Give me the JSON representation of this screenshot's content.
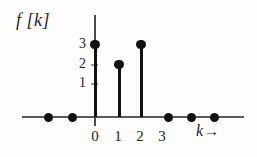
{
  "figure": {
    "ylabel": "f [k]",
    "xlabel": "k",
    "xlabel_arrow": "→"
  },
  "chart_data": {
    "type": "bar",
    "title": "",
    "subtitle": "",
    "xlabel": "k",
    "ylabel": "f[k]",
    "x": [
      -2,
      -1,
      0,
      1,
      2,
      3,
      4,
      5
    ],
    "values": [
      0,
      0,
      3,
      2,
      3,
      0,
      0,
      0
    ],
    "categories": [
      "-2",
      "-1",
      "0",
      "1",
      "2",
      "3",
      "4",
      "5"
    ],
    "xlim": [
      -2.8,
      6.0
    ],
    "ylim": [
      0,
      3.6
    ],
    "xticks": [
      0,
      1,
      2,
      3
    ],
    "xtick_labels": [
      "0",
      "1",
      "2",
      "3"
    ],
    "yticks": [
      1,
      2,
      3
    ],
    "ytick_labels": [
      "1",
      "2",
      "3"
    ],
    "grid": false,
    "legend": null,
    "marker": "filled-circle"
  },
  "yticks": [
    {
      "label": "3",
      "top": 37,
      "mark_top": 44
    },
    {
      "label": "2",
      "top": 57,
      "mark_top": 64
    },
    {
      "label": "1",
      "top": 76,
      "mark_top": 83
    }
  ],
  "xticks": [
    {
      "label": "0",
      "left": 87
    },
    {
      "label": "1",
      "left": 110
    },
    {
      "label": "2",
      "left": 132
    },
    {
      "label": "3",
      "left": 154
    }
  ],
  "stems": [
    {
      "k": "0",
      "left": 93.5,
      "top": 44,
      "height": 73
    },
    {
      "k": "1",
      "left": 117.5,
      "top": 64,
      "height": 53
    },
    {
      "k": "2",
      "left": 139.5,
      "top": 44,
      "height": 73
    }
  ],
  "stem_dots": [
    {
      "k": "0",
      "left": 90.3,
      "top": 39.5
    },
    {
      "k": "1",
      "left": 114.3,
      "top": 59.5
    },
    {
      "k": "2",
      "left": 136.3,
      "top": 39.5
    }
  ],
  "zero_dots": [
    {
      "k": "-2",
      "left": 43.5
    },
    {
      "k": "-1",
      "left": 67.5
    },
    {
      "k": "3",
      "left": 163.5
    },
    {
      "k": "4",
      "left": 186.5
    },
    {
      "k": "5",
      "left": 209.5
    }
  ]
}
